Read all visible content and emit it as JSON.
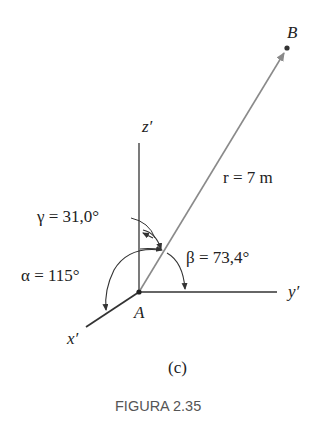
{
  "figure": {
    "caption": "FIGURA 2.35",
    "sublabel": "(c)"
  },
  "points": {
    "origin": "A",
    "tip": "B"
  },
  "axes": {
    "x": "x′",
    "y": "y′",
    "z": "z′"
  },
  "vector": {
    "label": "r = 7 m",
    "magnitude": 7,
    "unit": "m"
  },
  "angles": {
    "alpha": "α = 115°",
    "beta": "β = 73,4°",
    "gamma": "γ = 31,0°",
    "alpha_value": 115,
    "beta_value": 73.4,
    "gamma_value": 31.0
  },
  "colors": {
    "vector": "#8a8a8a",
    "axes": "#333333",
    "text": "#222222",
    "caption": "#555555"
  }
}
